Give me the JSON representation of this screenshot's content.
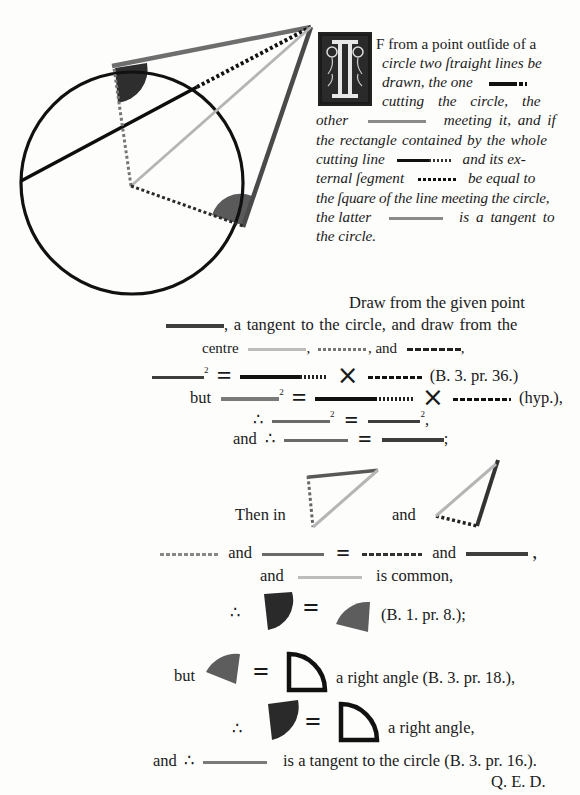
{
  "figure": {
    "colors": {
      "circle": "#111111",
      "tangent_top": "#6e6e6e",
      "tangent_right": "#4a4a4a",
      "centre_line": "#b5b5b5",
      "angle_dark": "#2e2e2e",
      "angle_medium": "#5a5a5a"
    }
  },
  "proposition": {
    "drop_cap": "I",
    "lines": [
      "F from a point outſide of a",
      "circle two ſtraight lines be",
      "drawn, the one",
      "cutting the circle, the",
      "other",
      "meeting it, and if",
      "the rectangle contained by the whole",
      "cutting line",
      "and its ex-",
      "ternal ſegment",
      "be equal to",
      "the ſquare of the line meeting the circle,",
      "the latter",
      "is a tangent to",
      "the circle."
    ]
  },
  "proof": {
    "l1": "Draw from the given point",
    "l2": ", a tangent to the circle, and draw from the",
    "l3_a": "centre",
    "l3_b": ",",
    "l3_c": ", and",
    "l3_d": ",",
    "sup2": "2",
    "eq": "=",
    "times": "×",
    "ref1": "(B. 3. pr. 36.)",
    "but": "but",
    "hyp": "(hyp.),",
    "therefore": "∴",
    "comma": ",",
    "and": "and",
    "semicolon": ";",
    "then_in": "Then in",
    "and_common": "is common,",
    "ref2": "(B. 1. pr. 8.);",
    "right_angle_ref": "a right angle (B. 3. pr. 18.),",
    "right_angle": "a right angle,",
    "tangent_conclusion": "is a tangent to the circle (B. 3. pr. 16.).",
    "qed": "Q. E. D."
  }
}
